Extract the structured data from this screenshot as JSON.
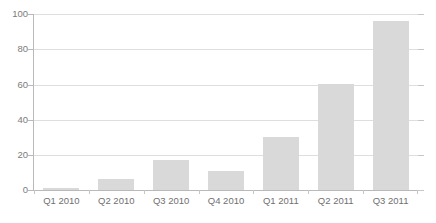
{
  "chart_data": {
    "type": "bar",
    "title": "",
    "subtitle": "",
    "xlabel": "",
    "ylabel": "",
    "categories": [
      "Q1 2010",
      "Q2 2010",
      "Q3 2010",
      "Q4 2010",
      "Q1 2011",
      "Q2 2011",
      "Q3 2011"
    ],
    "values": [
      1,
      6,
      17,
      11,
      30,
      60,
      96
    ],
    "ylim": [
      0,
      100
    ],
    "yticks": [
      0,
      20,
      40,
      60,
      80,
      100
    ],
    "ytick_labels": [
      "0",
      "20",
      "40",
      "60",
      "80",
      "100"
    ],
    "grid": true,
    "grid_axis": "y",
    "legend": false,
    "legend_position": "none",
    "series": [
      {
        "name": "",
        "values": [
          1,
          6,
          17,
          11,
          30,
          60,
          96
        ]
      }
    ]
  },
  "style": {
    "bar_color": "#d9d9d9",
    "gridline_color": "#dedede",
    "axis_color": "#b9b9b9",
    "tick_text_color": "#7b7b7b",
    "label_text_color": "#6f6f6f",
    "background": "#ffffff"
  }
}
